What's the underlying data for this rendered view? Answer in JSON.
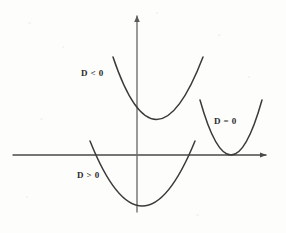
{
  "figure": {
    "kind": "math-diagram",
    "background_color": "#fdfdfb",
    "ink_color": "#3a3a3a",
    "label_color": "#2b2b2b",
    "width": 286,
    "height": 233
  },
  "axes": {
    "x_axis": {
      "name": "x-axis",
      "start": [
        13,
        155
      ],
      "end": [
        270,
        155
      ],
      "arrow": "right",
      "color": "#4a4a4a",
      "width": 1.4
    },
    "y_axis": {
      "name": "y-axis",
      "start": [
        137,
        212
      ],
      "end": [
        137,
        12
      ],
      "arrow": "up",
      "color": "#6e6e6e",
      "width": 1.4
    },
    "origin": [
      137,
      155
    ]
  },
  "chart_data": {
    "type": "line",
    "title": "",
    "xlabel": "",
    "ylabel": "",
    "grid": false,
    "legend": "inline-annotations",
    "series": [
      {
        "name": "D < 0",
        "label": "D < 0",
        "label_position": [
          81,
          69
        ],
        "roots": 0,
        "relation_to_x_axis": "entirely above",
        "vertex": [
          155,
          127
        ],
        "left_end": [
          113,
          57
        ],
        "right_end": [
          203,
          57
        ],
        "path": "M 113 57 Q 155 182 203 57",
        "color": "#3a3a3a",
        "width": 1.5
      },
      {
        "name": "D > 0",
        "label": "D > 0",
        "label_position": [
          77,
          171
        ],
        "roots": 2,
        "relation_to_x_axis": "crosses twice",
        "vertex": [
          140,
          205
        ],
        "left_end": [
          90,
          141
        ],
        "right_end": [
          195,
          141
        ],
        "x_intercepts": [
          103,
          178
        ],
        "path": "M 90 141 Q 142 271 195 141",
        "color": "#3a3a3a",
        "width": 1.5
      },
      {
        "name": "D = 0",
        "label": "D = 0",
        "label_position": [
          214,
          117
        ],
        "roots": 1,
        "relation_to_x_axis": "tangent",
        "vertex": [
          231,
          155
        ],
        "left_end": [
          200,
          100
        ],
        "right_end": [
          262,
          100
        ],
        "tangent_point": [
          231,
          155
        ],
        "path": "M 200 100 Q 231 210 262 100",
        "color": "#3a3a3a",
        "width": 1.5
      }
    ]
  },
  "labels": {
    "d_negative": "D < 0",
    "d_positive": "D > 0",
    "d_zero": "D = 0"
  }
}
